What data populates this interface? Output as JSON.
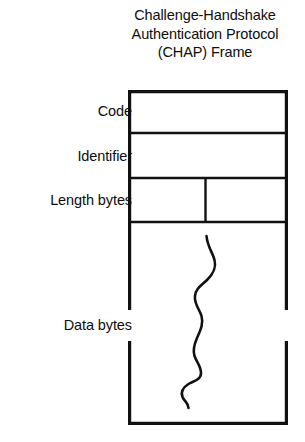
{
  "figure": {
    "title": {
      "line1": "Challenge-Handshake",
      "line2": "Authentication Protocol",
      "line3": "(CHAP) Frame"
    },
    "fields": [
      {
        "label": "Code"
      },
      {
        "label": "Identifier"
      },
      {
        "label": "Length bytes"
      },
      {
        "label": "Data bytes"
      }
    ],
    "colors": {
      "line": "#111111",
      "text": "#0d0d0d",
      "background": "#ffffff"
    }
  }
}
